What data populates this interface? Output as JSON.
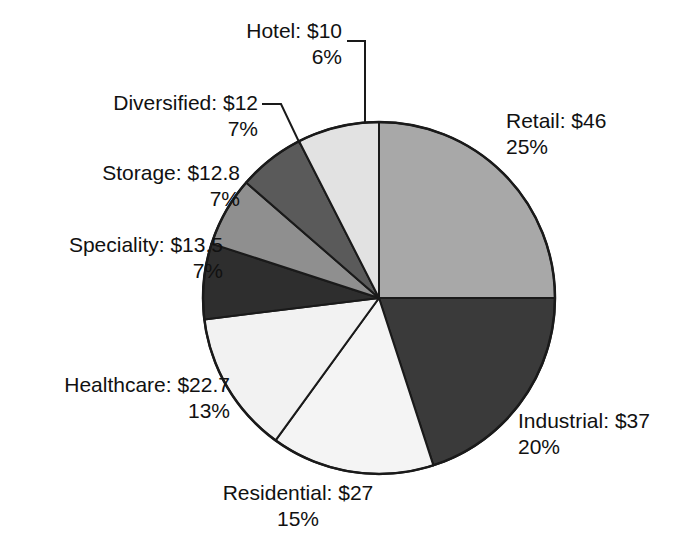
{
  "chart_data": {
    "type": "pie",
    "title": "",
    "subtitle": "",
    "xlabel": "",
    "ylabel": "",
    "legend_position": "none",
    "grid": false,
    "value_prefix": "$",
    "labels_show_value_and_percent": true,
    "categories": [
      "Retail",
      "Industrial",
      "Residential",
      "Healthcare",
      "Speciality",
      "Storage",
      "Diversified",
      "Hotel"
    ],
    "values": [
      46,
      37,
      27,
      22.7,
      13.5,
      12.8,
      12,
      10
    ],
    "percents": [
      25,
      20,
      15,
      13,
      7,
      7,
      7,
      6
    ],
    "colors": [
      "#a8a8a8",
      "#3a3a3a",
      "#f4f4f4",
      "#f2f2f2",
      "#2e2e2e",
      "#8f8f8f",
      "#5a5a5a",
      "#e2e2e2"
    ],
    "slices": [
      {
        "name": "Retail",
        "value_text": "Retail: $46",
        "percent_text": "25%",
        "value": 46,
        "percent": 25,
        "color": "#a8a8a8",
        "start_angle": 0,
        "end_angle": 90
      },
      {
        "name": "Industrial",
        "value_text": "Industrial: $37",
        "percent_text": "20%",
        "value": 37,
        "percent": 20,
        "color": "#3a3a3a",
        "start_angle": 90,
        "end_angle": 162
      },
      {
        "name": "Residential",
        "value_text": "Residential: $27",
        "percent_text": "15%",
        "value": 27,
        "percent": 15,
        "color": "#f4f4f4",
        "start_angle": 162,
        "end_angle": 216
      },
      {
        "name": "Healthcare",
        "value_text": "Healthcare: $22.7",
        "percent_text": "13%",
        "value": 22.7,
        "percent": 13,
        "color": "#f2f2f2",
        "start_angle": 216,
        "end_angle": 263
      },
      {
        "name": "Speciality",
        "value_text": "Speciality: $13.5",
        "percent_text": "7%",
        "value": 13.5,
        "percent": 7,
        "color": "#2e2e2e",
        "start_angle": 263,
        "end_angle": 288
      },
      {
        "name": "Storage",
        "value_text": "Storage: $12.8",
        "percent_text": "7%",
        "value": 12.8,
        "percent": 7,
        "color": "#8f8f8f",
        "start_angle": 288,
        "end_angle": 311
      },
      {
        "name": "Diversified",
        "value_text": "Diversified: $12",
        "percent_text": "7%",
        "value": 12,
        "percent": 7,
        "color": "#5a5a5a",
        "start_angle": 311,
        "end_angle": 333
      },
      {
        "name": "Hotel",
        "value_text": "Hotel: $10",
        "percent_text": "6%",
        "value": 10,
        "percent": 6,
        "color": "#e2e2e2",
        "start_angle": 333,
        "end_angle": 360
      }
    ],
    "geometry": {
      "center_x": 379,
      "center_y": 298,
      "radius": 176
    },
    "style": {
      "outline_color": "#1a1a1a",
      "label_color": "#111111",
      "background": "#ffffff"
    }
  }
}
